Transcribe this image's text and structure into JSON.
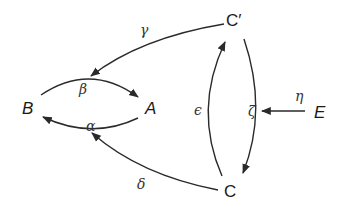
{
  "diagram": {
    "type": "directed-graph",
    "colors": {
      "stroke": "#2a2a2a",
      "text": "#1a1a1a",
      "background": "#ffffff"
    },
    "nodes": {
      "B": {
        "label": "B"
      },
      "A": {
        "label": "A"
      },
      "Cprime": {
        "label": "C′"
      },
      "C": {
        "label": "C"
      },
      "E": {
        "label": "E"
      }
    },
    "edges": {
      "beta": {
        "label": "β",
        "from": "B",
        "to": "A"
      },
      "alpha": {
        "label": "α",
        "from": "A",
        "to": "B"
      },
      "gamma": {
        "label": "γ",
        "from": "C′",
        "to": "β-edge"
      },
      "delta": {
        "label": "δ",
        "from": "C",
        "to": "α-edge"
      },
      "epsilon": {
        "label": "ϵ",
        "from": "C",
        "to": "C′"
      },
      "zeta": {
        "label": "ζ",
        "from": "C′",
        "to": "C"
      },
      "eta": {
        "label": "η",
        "from": "E",
        "to": "ζ-edge"
      }
    }
  }
}
